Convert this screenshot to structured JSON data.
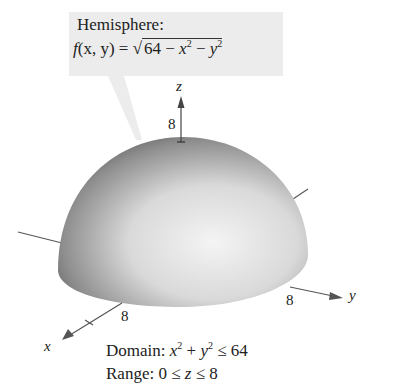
{
  "callout": {
    "title": "Hemisphere:",
    "formula": {
      "lhs_f": "f",
      "lhs_args": "(x, y) = ",
      "sqrt_symbol": "√",
      "term_const": "64 − ",
      "term_x": "x",
      "exp_x": "2",
      "minus": " − ",
      "term_y": "y",
      "exp_y": "2"
    }
  },
  "axes": {
    "z": {
      "label": "z",
      "tick": "8"
    },
    "y": {
      "label": "y",
      "tick": "8"
    },
    "x": {
      "label": "x",
      "tick": "8"
    }
  },
  "caption": {
    "domain_prefix": "Domain: ",
    "domain_x": "x",
    "domain_exp1": "2",
    "domain_plus": " + ",
    "domain_y": "y",
    "domain_exp2": "2",
    "domain_rest": " ≤ 64",
    "range_prefix": "Range: ",
    "range_rest_a": "0 ≤ ",
    "range_z": "z",
    "range_rest_b": " ≤ 8"
  },
  "colors": {
    "callout_bg": "#ececec",
    "axis": "#555555",
    "dome_dark": "#5a5a5a",
    "dome_light": "#f2f2f2"
  }
}
